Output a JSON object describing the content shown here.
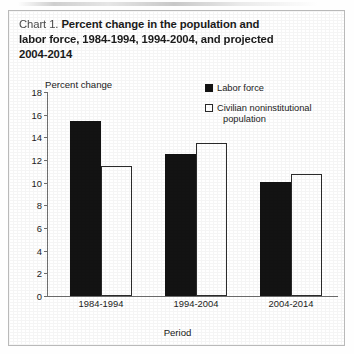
{
  "title": {
    "lead": "Chart 1.",
    "line1": "Percent change in the population and",
    "line2": "labor force, 1984-1994, 1994-2004, and projected",
    "line3": "2004-2014"
  },
  "legend": {
    "items": [
      {
        "label": "Labor force",
        "swatch": "filled-square-icon",
        "color": "#131313"
      },
      {
        "label": "Civilian noninstitutional",
        "label_cont": "population",
        "swatch": "open-square-icon",
        "color": "#ffffff"
      }
    ]
  },
  "axes": {
    "y_title": "Percent change",
    "x_title": "Period"
  },
  "chart_data": {
    "type": "bar",
    "title": "Chart 1. Percent change in the population and labor force, 1984-1994, 1994-2004, and projected 2004-2014",
    "xlabel": "Period",
    "ylabel": "Percent change",
    "categories": [
      "1984-1994",
      "1994-2004",
      "2004-2014"
    ],
    "series": [
      {
        "name": "Labor force",
        "values": [
          15.4,
          12.5,
          10.1
        ],
        "color": "#131313",
        "fill": "solid"
      },
      {
        "name": "Civilian noninstitutional population",
        "values": [
          11.5,
          13.5,
          10.8
        ],
        "color": "#ffffff",
        "fill": "open"
      }
    ],
    "ylim": [
      0,
      18
    ],
    "ytick_values": [
      18,
      16,
      14,
      12,
      10,
      8,
      6,
      4,
      2,
      0
    ],
    "ytick_labels": [
      "18",
      "16",
      "14",
      "12",
      "10",
      "8",
      "6",
      "4",
      "2",
      "0"
    ],
    "grid": false,
    "legend_position": "top-right"
  }
}
